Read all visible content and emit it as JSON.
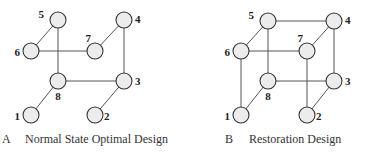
{
  "diagrams": [
    {
      "id": "A",
      "letter": "A",
      "caption": "Normal State Optimal Design",
      "nodes": [
        "1",
        "2",
        "3",
        "4",
        "5",
        "6",
        "7",
        "8"
      ],
      "edges": [
        [
          "5",
          "6"
        ],
        [
          "5",
          "8"
        ],
        [
          "6",
          "7"
        ],
        [
          "7",
          "4"
        ],
        [
          "4",
          "3"
        ],
        [
          "8",
          "3"
        ],
        [
          "8",
          "1"
        ],
        [
          "3",
          "2"
        ]
      ]
    },
    {
      "id": "B",
      "letter": "B",
      "caption": "Restoration Design",
      "nodes": [
        "1",
        "2",
        "3",
        "4",
        "5",
        "6",
        "7",
        "8"
      ],
      "edges": [
        [
          "5",
          "4"
        ],
        [
          "5",
          "6"
        ],
        [
          "5",
          "8"
        ],
        [
          "4",
          "7"
        ],
        [
          "4",
          "3"
        ],
        [
          "6",
          "7"
        ],
        [
          "6",
          "1"
        ],
        [
          "7",
          "2"
        ],
        [
          "8",
          "3"
        ],
        [
          "8",
          "1"
        ],
        [
          "3",
          "2"
        ]
      ]
    }
  ]
}
